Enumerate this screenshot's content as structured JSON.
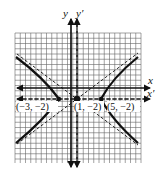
{
  "diagram": {
    "type": "hyperbola-translated-axes",
    "grid": {
      "x_min": -12,
      "x_max": 12,
      "y_min": -14,
      "y_max": 10,
      "unit_px": 5.25
    },
    "axes": {
      "x_label": "x",
      "y_label": "y",
      "x_prime_label": "x′",
      "y_prime_label": "y′"
    },
    "center": {
      "label": "(1, −2)",
      "x": 1,
      "y": -2
    },
    "vertices": [
      {
        "label": "(−3, −2)",
        "x": -3,
        "y": -2
      },
      {
        "label": "(5, −2)",
        "x": 5,
        "y": -2
      }
    ],
    "colors": {
      "curve": "#111111",
      "grid": "#555555",
      "background": "#ffffff"
    }
  }
}
